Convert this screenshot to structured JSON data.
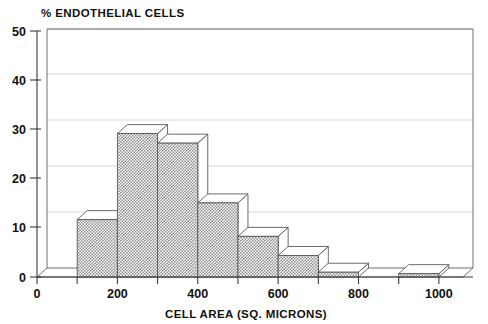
{
  "chart_data": {
    "type": "bar",
    "title": "% ENDOTHELIAL CELLS",
    "subtitle": "",
    "xlabel": "CELL AREA (SQ. MICRONS)",
    "ylabel": "",
    "xlim": [
      0,
      1060
    ],
    "ylim": [
      0,
      50
    ],
    "grid": true,
    "legend": false,
    "style": "pseudo-3d-histogram",
    "bin_width": 100,
    "x_tick_labels": [
      "0",
      "200",
      "400",
      "600",
      "800",
      "1000"
    ],
    "x_tick_values": [
      0,
      200,
      400,
      600,
      800,
      1000
    ],
    "x_minor_tick_values": [
      0,
      100,
      200,
      300,
      400,
      500,
      600,
      700,
      800,
      900,
      1000
    ],
    "y_tick_labels": [
      "0",
      "10",
      "20",
      "30",
      "40",
      "50"
    ],
    "y_tick_values": [
      0,
      10,
      20,
      30,
      40,
      50
    ],
    "categories": [
      "100-200",
      "200-300",
      "300-400",
      "400-500",
      "500-600",
      "600-700",
      "700-800",
      "800-900",
      "900-1000"
    ],
    "bin_starts": [
      100,
      200,
      300,
      400,
      500,
      600,
      700,
      800,
      900
    ],
    "values": [
      12,
      30,
      28,
      15.5,
      8.5,
      4.5,
      1,
      0,
      0.7
    ],
    "colors": {
      "bar_fill": "#b5b5b5",
      "bar_outline": "#5a5a5a",
      "bar_top_face": "#ffffff",
      "gridline": "#d8d8d8",
      "axis": "#3a3a3a",
      "frame": "#6e6e6e",
      "text": "#111111",
      "background": "#ffffff"
    }
  },
  "axes": {
    "title": "% ENDOTHELIAL CELLS",
    "x_axis_title": "CELL AREA (SQ. MICRONS)",
    "y_ticks": [
      {
        "label": "50",
        "value": 50
      },
      {
        "label": "40",
        "value": 40
      },
      {
        "label": "30",
        "value": 30
      },
      {
        "label": "20",
        "value": 20
      },
      {
        "label": "10",
        "value": 10
      },
      {
        "label": "0",
        "value": 0
      }
    ],
    "x_ticks": [
      {
        "label": "0",
        "value": 0
      },
      {
        "label": "200",
        "value": 200
      },
      {
        "label": "400",
        "value": 400
      },
      {
        "label": "600",
        "value": 600
      },
      {
        "label": "800",
        "value": 800
      },
      {
        "label": "1000",
        "value": 1000
      }
    ]
  }
}
